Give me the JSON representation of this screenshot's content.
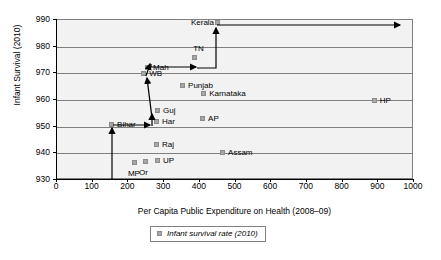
{
  "chart_data": {
    "type": "scatter",
    "title": "",
    "xlabel": "Per Capita Public Expenditure on Health (2008–09)",
    "ylabel": "Infant Survival (2010)",
    "xlim": [
      0,
      1000
    ],
    "ylim": [
      930,
      990
    ],
    "xticks": [
      0,
      100,
      200,
      300,
      400,
      500,
      600,
      700,
      800,
      900,
      1000
    ],
    "yticks": [
      930,
      940,
      950,
      960,
      970,
      980,
      990
    ],
    "grid": "horizontal",
    "legend": {
      "position": "bottom-center",
      "entries": [
        {
          "name": "Infant survival rate (2010)",
          "marker": "square",
          "color": "#a6a6a6"
        }
      ]
    },
    "series": [
      {
        "name": "Infant survival rate (2010)",
        "points": [
          {
            "label": "Kerala",
            "x": 454,
            "y": 988.5,
            "label_pos": "left"
          },
          {
            "label": "TN",
            "x": 390,
            "y": 975.5,
            "label_pos": "above"
          },
          {
            "label": "Mah",
            "x": 258,
            "y": 971.5,
            "label_pos": "right"
          },
          {
            "label": "WB",
            "x": 247,
            "y": 969.5,
            "label_pos": "right"
          },
          {
            "label": "Punjab",
            "x": 356,
            "y": 965.0,
            "label_pos": "right"
          },
          {
            "label": "Karnataka",
            "x": 415,
            "y": 961.8,
            "label_pos": "right"
          },
          {
            "label": "HP",
            "x": 893,
            "y": 959.3,
            "label_pos": "right"
          },
          {
            "label": "Guj",
            "x": 286,
            "y": 955.5,
            "label_pos": "right"
          },
          {
            "label": "AP",
            "x": 412,
            "y": 952.5,
            "label_pos": "right"
          },
          {
            "label": "Bihar",
            "x": 157,
            "y": 950.3,
            "label_pos": "right"
          },
          {
            "label": "Har",
            "x": 283,
            "y": 951.5,
            "label_pos": "right"
          },
          {
            "label": "Raj",
            "x": 283,
            "y": 942.8,
            "label_pos": "right"
          },
          {
            "label": "Assam",
            "x": 468,
            "y": 939.8,
            "label_pos": "right"
          },
          {
            "label": "UP",
            "x": 286,
            "y": 936.8,
            "label_pos": "right"
          },
          {
            "label": "Or",
            "x": 252,
            "y": 936.4,
            "label_pos": "below"
          },
          {
            "label": "MP",
            "x": 221,
            "y": 936.0,
            "label_pos": "below"
          }
        ]
      }
    ],
    "annotations": {
      "description": "Black stepped arrow path tracing from the x-axis up through Bihar, Guj, WB/Mah, TN and Kerala, then extending right.",
      "arrow_color": "#000000"
    }
  },
  "axis": {
    "y_tick_labels": [
      "990",
      "980",
      "970",
      "960",
      "950",
      "940",
      "930"
    ],
    "x_tick_labels": [
      "0",
      "100",
      "200",
      "300",
      "400",
      "500",
      "600",
      "700",
      "800",
      "900",
      "1000"
    ],
    "y_title": "Infant Survival (2010)",
    "x_title": "Per Capita Public Expenditure on Health (2008–09)"
  },
  "legend": {
    "label": "Infant survival rate (2010)"
  }
}
